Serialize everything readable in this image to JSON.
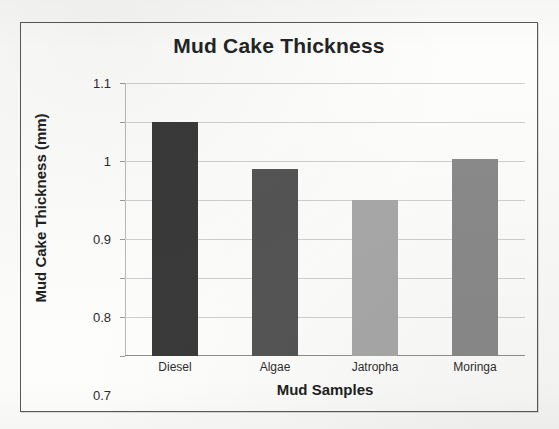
{
  "chart_data": {
    "type": "bar",
    "title": "Mud Cake Thickness",
    "xlabel": "Mud Samples",
    "ylabel": "Mud Cake Thickness (mm)",
    "categories": [
      "Diesel",
      "Algae",
      "Jatropha",
      "Moringa"
    ],
    "values": [
      1.0,
      0.88,
      0.8,
      0.905
    ],
    "series": [
      {
        "name": "Mud Cake Thickness",
        "values": [
          1.0,
          0.88,
          0.8,
          0.905
        ]
      }
    ],
    "bar_colors": [
      "#3a3a3a",
      "#555555",
      "#a8a8a8",
      "#8a8a8a"
    ],
    "ylim": [
      0.4,
      1.1
    ],
    "ytick_labels": [
      "1.1",
      "1",
      "0.9",
      "0.8",
      "0.7",
      "0.6",
      "0.5",
      "0.4"
    ],
    "ytick_values": [
      1.1,
      1.0,
      0.9,
      0.8,
      0.7,
      0.6,
      0.5,
      0.4
    ],
    "grid": true,
    "legend": false,
    "legend_position": "none"
  }
}
